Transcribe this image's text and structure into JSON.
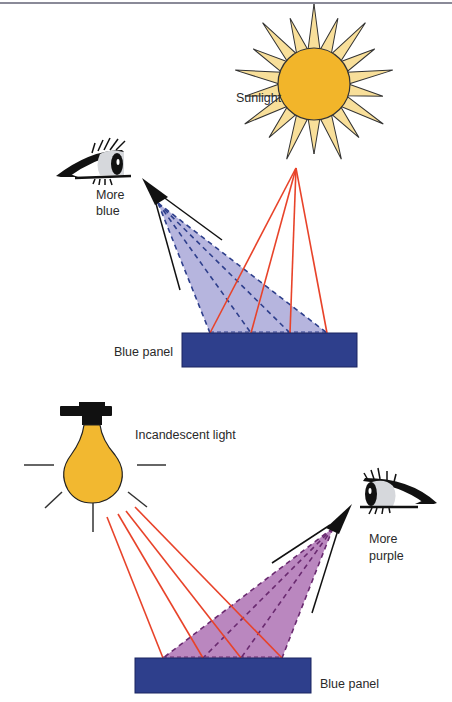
{
  "figure": {
    "top_scene": {
      "light_source_label": "Sunlight",
      "observer_label_line1": "More",
      "observer_label_line2": "blue",
      "panel_label": "Blue panel"
    },
    "bottom_scene": {
      "light_source_label": "Incandescent light",
      "observer_label_line1": "More",
      "observer_label_line2": "purple",
      "panel_label": "Blue panel"
    }
  },
  "colors": {
    "sun_core": "#f2b52a",
    "sun_rays": "#f8df9a",
    "bulb": "#f2b830",
    "panel": "#2e3f8c",
    "incident_ray": "#e8432a",
    "reflected_blue": "#a9a8d8",
    "reflected_purple": "#b27ab8",
    "divider": "#8a8a98"
  }
}
